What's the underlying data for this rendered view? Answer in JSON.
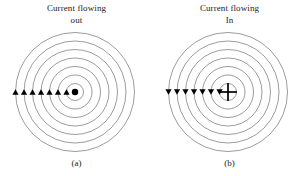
{
  "figure": {
    "background_color": "#ffffff",
    "stroke_color": "#4a4a4a",
    "marker_color": "#000000",
    "panels": [
      {
        "id": "panel-a",
        "title_line1": "Current flowing",
        "title_line2": "out",
        "caption": "(a)",
        "center_marker": "dot",
        "arrow_direction": "up",
        "arrow_count": 7,
        "ring_count": 7,
        "center_x": 75,
        "center_y": 64,
        "ring_radii": [
          8.5,
          17,
          25.5,
          34,
          42.5,
          51,
          59.5
        ],
        "center_dot_radius": 3.2
      },
      {
        "id": "panel-b",
        "title_line1": "Current flowing",
        "title_line2": "In",
        "caption": "(b)",
        "center_marker": "cross",
        "arrow_direction": "down",
        "arrow_count": 7,
        "ring_count": 7,
        "center_x": 75,
        "center_y": 64,
        "ring_radii": [
          8.5,
          17,
          25.5,
          34,
          42.5,
          51,
          59.5
        ],
        "center_cross_half": 9
      }
    ]
  }
}
